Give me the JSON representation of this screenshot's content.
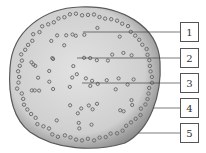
{
  "diagram": {
    "labels": [
      {
        "number": "1",
        "box": {
          "x": 180,
          "y": 22
        },
        "line_start": {
          "x": 83,
          "y": 34
        }
      },
      {
        "number": "2",
        "box": {
          "x": 180,
          "y": 48
        },
        "line_start": {
          "x": 77,
          "y": 62
        }
      },
      {
        "number": "3",
        "box": {
          "x": 180,
          "y": 73
        },
        "line_start": {
          "x": 82,
          "y": 84
        }
      },
      {
        "number": "4",
        "box": {
          "x": 180,
          "y": 98
        },
        "line_start": {
          "x": 153,
          "y": 111
        }
      },
      {
        "number": "5",
        "box": {
          "x": 180,
          "y": 123
        },
        "line_start": {
          "x": 138,
          "y": 134
        }
      }
    ],
    "colors": {
      "fill": "#d6d6d6",
      "edge": "#6a6a6a",
      "dots": "#7a7a7a",
      "line": "#444444"
    }
  }
}
